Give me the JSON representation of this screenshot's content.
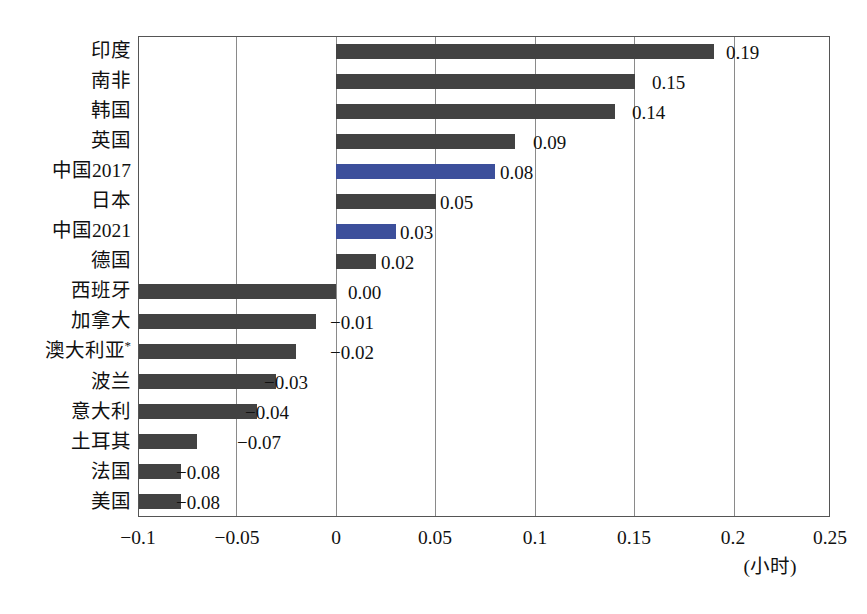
{
  "chart_data": {
    "type": "bar",
    "orientation": "horizontal",
    "title": "",
    "subtitle": "",
    "xlabel": "(小时)",
    "ylabel": "",
    "xlim": [
      -0.1,
      0.25
    ],
    "xticks": [
      "−0.1",
      "−0.05",
      "0",
      "0.05",
      "0.1",
      "0.15",
      "0.2",
      "0.25"
    ],
    "xtick_values": [
      -0.1,
      -0.05,
      0,
      0.05,
      0.1,
      0.15,
      0.2,
      0.25
    ],
    "grid": true,
    "legend": null,
    "categories": [
      "印度",
      "南非",
      "韩国",
      "英国",
      "中国2017",
      "日本",
      "中国2021",
      "德国",
      "西班牙",
      "加拿大",
      "澳大利亚*",
      "波兰",
      "意大利",
      "土耳其",
      "法国",
      "美国"
    ],
    "values": [
      0.19,
      0.15,
      0.14,
      0.09,
      0.08,
      0.05,
      0.03,
      0.02,
      0.0,
      -0.01,
      -0.02,
      -0.03,
      -0.04,
      -0.07,
      -0.08,
      -0.08
    ],
    "value_labels": [
      "0.19",
      "0.15",
      "0.14",
      "0.09",
      "0.08",
      "0.05",
      "0.03",
      "0.02",
      "0.00",
      "−0.01",
      "−0.02",
      "−0.03",
      "−0.04",
      "−0.07",
      "−0.08",
      "−0.08"
    ],
    "bar_colors": [
      "dark",
      "dark",
      "dark",
      "dark",
      "blue",
      "dark",
      "blue",
      "dark",
      "dark",
      "dark",
      "dark",
      "dark",
      "dark",
      "dark",
      "dark",
      "dark"
    ],
    "highlight_categories": [
      "中国2017",
      "中国2021"
    ],
    "colors": {
      "bar_dark": "#424242",
      "bar_highlight": "#3c4f9b",
      "gridline": "#8a8a8a",
      "axis": "#555555",
      "text": "#111111",
      "background": "#ffffff"
    }
  }
}
